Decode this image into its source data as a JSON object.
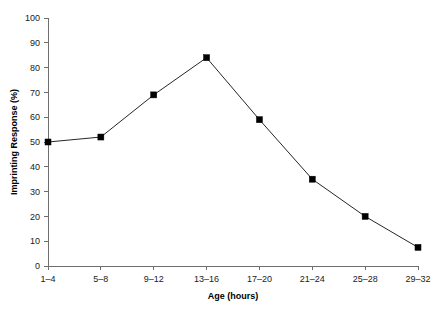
{
  "chart_data": {
    "type": "line",
    "title": "",
    "xlabel": "Age (hours)",
    "ylabel": "Imprinting Response (%)",
    "categories": [
      "1–4",
      "5–8",
      "9–12",
      "13–16",
      "17–20",
      "21–24",
      "25–28",
      "29–32"
    ],
    "values": [
      50,
      52,
      69,
      84,
      59,
      35,
      20,
      7.5
    ],
    "series": [
      {
        "name": "Imprinting Response",
        "values": [
          50,
          52,
          69,
          84,
          59,
          35,
          20,
          7.5
        ]
      }
    ],
    "ylim": [
      0,
      100
    ],
    "ytick_labels": [
      "0",
      "10",
      "20",
      "30",
      "40",
      "50",
      "60",
      "70",
      "80",
      "90",
      "100"
    ],
    "ytick_values": [
      0,
      10,
      20,
      30,
      40,
      50,
      60,
      70,
      80,
      90,
      100
    ],
    "grid": false,
    "legend": false,
    "legend_position": "none",
    "marker_style": "filled-square",
    "line_color": "#262626",
    "marker_color": "#000000",
    "axis_color": "#6e6e6e",
    "background_color": "#ffffff"
  },
  "figure": {
    "y_axis_title": "Imprinting Response (%)",
    "x_axis_title": "Age (hours)"
  }
}
